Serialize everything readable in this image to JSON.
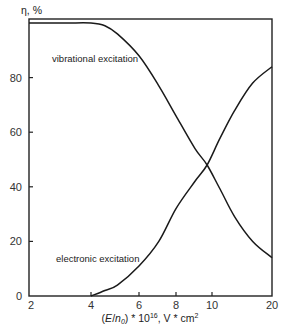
{
  "chart_data": {
    "type": "line",
    "title": "",
    "xlabel": "(E/n0) * 10^16, V * cm^2",
    "xlabel_parts": {
      "pre": "(",
      "italic1": "E",
      "slash": "/",
      "italic2": "n",
      "sub": "0",
      "post": ") * 10",
      "sup": "16",
      "unit": ", V * cm",
      "unit_sup": "2"
    },
    "ylabel": "η, %",
    "xscale": "log",
    "xlim": [
      2,
      20
    ],
    "ylim": [
      0,
      100
    ],
    "x_ticks": [
      2,
      4,
      6,
      8,
      10,
      20
    ],
    "x_tick_labels": [
      "2",
      "4",
      "6",
      "8",
      "10",
      "20"
    ],
    "y_ticks": [
      0,
      20,
      40,
      60,
      80
    ],
    "y_tick_labels": [
      "0",
      "20",
      "40",
      "60",
      "80"
    ],
    "grid": false,
    "legend": null,
    "annotations": [
      {
        "text": "vibrational excitation",
        "series": "vibrational excitation"
      },
      {
        "text": "electronic excitation",
        "series": "electronic excitation"
      }
    ],
    "series": [
      {
        "name": "vibrational excitation",
        "x": [
          2,
          3,
          4,
          4.5,
          5,
          6,
          7,
          8,
          9,
          9.7,
          11,
          13,
          16,
          20
        ],
        "y": [
          100,
          100,
          100,
          99,
          96,
          88,
          77,
          66,
          54,
          48,
          39,
          29,
          20,
          14
        ]
      },
      {
        "name": "electronic excitation",
        "x": [
          4,
          4.5,
          5,
          6,
          7,
          8,
          9,
          9.7,
          11,
          13,
          16,
          20
        ],
        "y": [
          0,
          2,
          4,
          11,
          20,
          32,
          42,
          48,
          58,
          68,
          78,
          84
        ]
      }
    ],
    "crossing_point": {
      "x": 9.7,
      "y": 48
    }
  }
}
